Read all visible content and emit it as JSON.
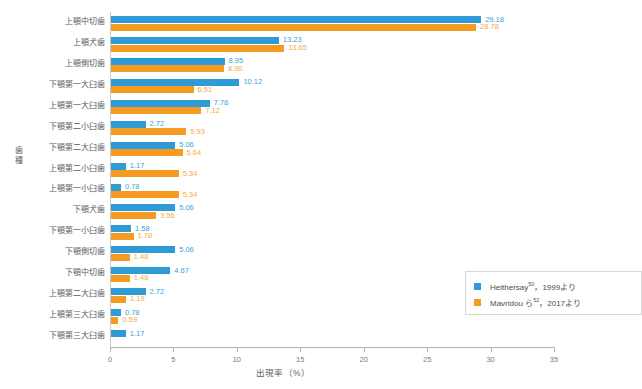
{
  "chart_data": {
    "type": "bar",
    "orientation": "horizontal",
    "title": "",
    "xlabel": "出現率（%）",
    "ylabel": "歯種",
    "xlim": [
      0,
      35
    ],
    "xticks": [
      "0",
      "5",
      "10",
      "15",
      "20",
      "25",
      "30",
      "35"
    ],
    "grid": false,
    "legend_position": "inside-bottom-right",
    "categories": [
      "上顎中切歯",
      "上顎犬歯",
      "上顎側切歯",
      "下顎第一大臼歯",
      "上顎第一大臼歯",
      "下顎第二小臼歯",
      "下顎第二大臼歯",
      "上顎第二小臼歯",
      "上顎第一小臼歯",
      "下顎犬歯",
      "下顎第一小臼歯",
      "下顎側切歯",
      "下顎中切歯",
      "上顎第二大臼歯",
      "上顎第三大臼歯",
      "下顎第三大臼歯"
    ],
    "series": [
      {
        "name": "Heithersay50, 1999より",
        "color": "#2e9bd6",
        "values": [
          29.18,
          13.23,
          8.95,
          10.12,
          7.78,
          2.72,
          5.06,
          1.17,
          0.78,
          5.06,
          1.58,
          5.06,
          4.67,
          2.72,
          0.78,
          1.17
        ],
        "labels": [
          "29.18",
          "13.23",
          "8.95",
          "10.12",
          "7.78",
          "2.72",
          "5.06",
          "1.17",
          "0.78",
          "5.06",
          "1.58",
          "5.06",
          "4.67",
          "2.72",
          "0.78",
          "1.17"
        ]
      },
      {
        "name": "Mavridou ら52, 2017より",
        "color": "#f59b21",
        "values": [
          28.78,
          13.65,
          8.9,
          6.51,
          7.12,
          5.93,
          5.64,
          5.34,
          5.34,
          3.56,
          1.78,
          1.48,
          1.48,
          1.19,
          0.59,
          0.0
        ],
        "labels": [
          "28.78",
          "13.65",
          "8.90",
          "6.51",
          "7.12",
          "5.93",
          "5.64",
          "5.34",
          "5.34",
          "3.56",
          "1.78",
          "1.48",
          "1.48",
          "1.19",
          "0.59",
          ""
        ]
      }
    ]
  },
  "legend": {
    "items": [
      {
        "label_main": "Heithersay",
        "label_sup": "50",
        "label_rest": "，1999より",
        "color": "#2e9bd6"
      },
      {
        "label_main": "Mavridou ら",
        "label_sup": "52",
        "label_rest": "，2017より",
        "color": "#f59b21"
      }
    ]
  }
}
